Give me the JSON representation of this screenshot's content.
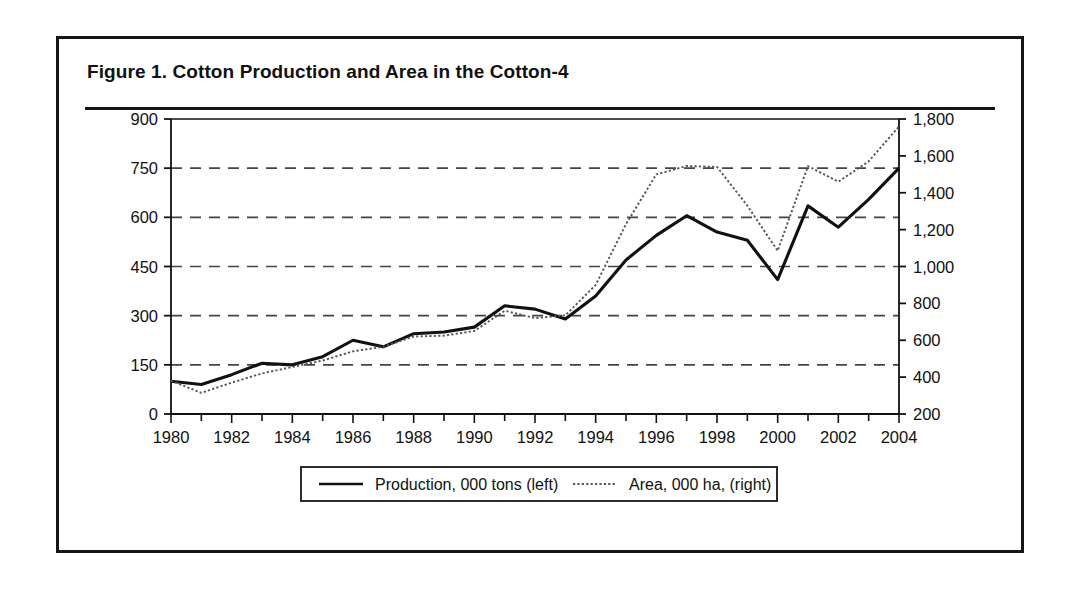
{
  "figure": {
    "title": "Figure 1.  Cotton Production and Area in the Cotton-4"
  },
  "legend": {
    "production_label": "Production, 000 tons (left)",
    "area_label": "Area, 000 ha, (right)"
  },
  "colors": {
    "frame": "#161616",
    "production_line": "#111111",
    "area_line": "#555555",
    "gridline": "#444444",
    "axis": "#111111"
  },
  "chart_data": {
    "type": "line",
    "title": "Figure 1.  Cotton Production and Area in the Cotton-4",
    "xlabel": "",
    "ylabel": "",
    "grid": true,
    "legend_position": "bottom-center",
    "x": [
      1980,
      1981,
      1982,
      1983,
      1984,
      1985,
      1986,
      1987,
      1988,
      1989,
      1990,
      1991,
      1992,
      1993,
      1994,
      1995,
      1996,
      1997,
      1998,
      1999,
      2000,
      2001,
      2002,
      2003,
      2004
    ],
    "x_tick_labels": [
      "1980",
      "",
      "1982",
      "",
      "1984",
      "",
      "1986",
      "",
      "1988",
      "",
      "1990",
      "",
      "1992",
      "",
      "1994",
      "",
      "1996",
      "",
      "1998",
      "",
      "2000",
      "",
      "2002",
      "",
      "2004"
    ],
    "x_major_labels": [
      "1980",
      "1982",
      "1984",
      "1986",
      "1988",
      "1990",
      "1992",
      "1994",
      "1996",
      "1998",
      "2000",
      "2002",
      "2004"
    ],
    "xlim": [
      1980,
      2004
    ],
    "left_axis": {
      "name": "Production, 000 tons",
      "ylim": [
        0,
        900
      ],
      "ticks": [
        0,
        150,
        300,
        450,
        600,
        750,
        900
      ],
      "tick_labels": [
        "0",
        "150",
        "300",
        "450",
        "600",
        "750",
        "900"
      ]
    },
    "right_axis": {
      "name": "Area, 000 ha",
      "ylim": [
        200,
        1800
      ],
      "ticks": [
        200,
        400,
        600,
        800,
        1000,
        1200,
        1400,
        1600,
        1800
      ],
      "tick_labels": [
        "200",
        "400",
        "600",
        "800",
        "1,000",
        "1,200",
        "1,400",
        "1,600",
        "1,800"
      ]
    },
    "series": [
      {
        "name": "Production, 000 tons (left)",
        "axis": "left",
        "style": "solid",
        "values": [
          100,
          90,
          120,
          155,
          150,
          175,
          225,
          205,
          245,
          250,
          265,
          330,
          320,
          290,
          360,
          470,
          545,
          605,
          555,
          530,
          410,
          635,
          570,
          655,
          750
        ]
      },
      {
        "name": "Area, 000 ha, (right)",
        "axis": "right",
        "style": "dotted",
        "values": [
          380,
          315,
          370,
          420,
          455,
          490,
          540,
          565,
          620,
          625,
          650,
          760,
          720,
          735,
          900,
          1230,
          1500,
          1545,
          1540,
          1330,
          1085,
          1545,
          1460,
          1570,
          1760
        ]
      }
    ]
  }
}
